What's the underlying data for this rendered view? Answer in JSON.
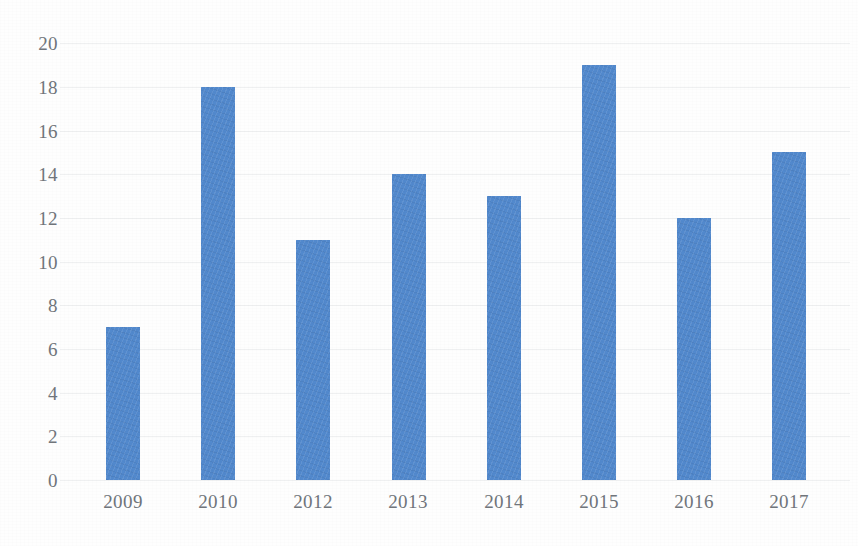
{
  "chart_data": {
    "type": "bar",
    "title": "",
    "subtitle": "",
    "xlabel": "",
    "ylabel": "",
    "categories": [
      "2009",
      "2010",
      "2012",
      "2013",
      "2014",
      "2015",
      "2016",
      "2017"
    ],
    "values": [
      7,
      18,
      11,
      14,
      13,
      19,
      12,
      15
    ],
    "ylim": [
      0,
      20
    ],
    "ytick_step": 2,
    "yticks": [
      "20",
      "18",
      "16",
      "14",
      "12",
      "10",
      "8",
      "6",
      "4",
      "2",
      "0"
    ],
    "grid": "faint-horizontal",
    "legend": "none",
    "bar_color": "#5289cd",
    "axis_label_color": "#70757b",
    "background_color": "#fefefe",
    "annotations": []
  }
}
